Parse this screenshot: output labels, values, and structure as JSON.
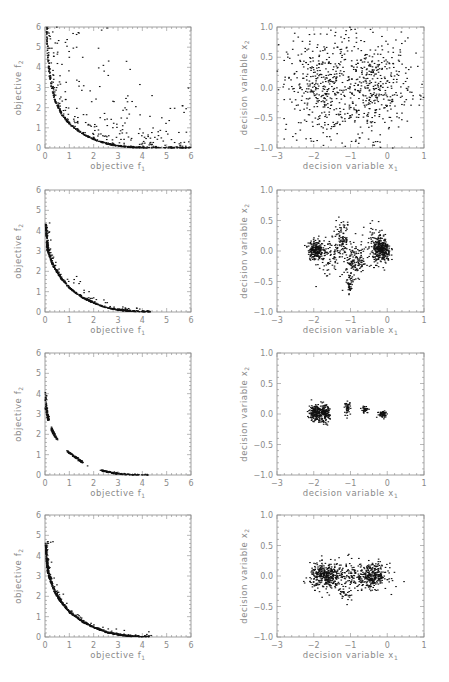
{
  "figure": {
    "rows": 4,
    "columns": 2,
    "axis_color": "#8a8a8a",
    "point_color": "#111111"
  },
  "labels": {
    "objective_x": "objective f",
    "objective_x_sub": "1",
    "objective_y": "objective f",
    "objective_y_sub": "2",
    "decision_x": "decision variable x",
    "decision_x_sub": "1",
    "decision_y": "decision variable x",
    "decision_y_sub": "2"
  },
  "chart_data": [
    {
      "panel": "row1-left",
      "type": "scatter",
      "xlabel": "objective f1",
      "ylabel": "objective f2",
      "xlim": [
        0,
        6
      ],
      "ylim": [
        0,
        6
      ],
      "xticks": [
        "0",
        "1",
        "2",
        "3",
        "4",
        "5",
        "6"
      ],
      "yticks": [
        "0",
        "1",
        "2",
        "3",
        "4",
        "5",
        "6"
      ],
      "description": "Dense front along convex curve plus widely scattered dominated points",
      "front": [
        [
          0.05,
          6.0
        ],
        [
          0.1,
          4.5
        ],
        [
          0.2,
          3.3
        ],
        [
          0.4,
          2.3
        ],
        [
          0.7,
          1.6
        ],
        [
          1.0,
          1.15
        ],
        [
          1.5,
          0.7
        ],
        [
          2.0,
          0.4
        ],
        [
          2.5,
          0.2
        ],
        [
          3.0,
          0.08
        ],
        [
          3.5,
          0.02
        ],
        [
          4.0,
          0.0
        ],
        [
          5.0,
          0.0
        ],
        [
          6.0,
          0.0
        ]
      ],
      "scatter_spread": 2.2,
      "n_front": 420,
      "n_scatter": 260,
      "outliers": [
        [
          1.3,
          5.0
        ],
        [
          2.2,
          4.95
        ],
        [
          3.35,
          4.3
        ],
        [
          3.5,
          3.9
        ],
        [
          2.6,
          3.6
        ],
        [
          3.9,
          3.15
        ],
        [
          2.4,
          4.1
        ],
        [
          4.4,
          2.6
        ],
        [
          5.65,
          2.1
        ],
        [
          5.8,
          1.95
        ],
        [
          4.8,
          1.5
        ],
        [
          3.35,
          1.9
        ],
        [
          2.55,
          5.95
        ],
        [
          1.4,
          5.7
        ],
        [
          1.0,
          4.5
        ],
        [
          1.55,
          4.5
        ]
      ]
    },
    {
      "panel": "row1-right",
      "type": "scatter",
      "xlabel": "decision variable x1",
      "ylabel": "decision variable x2",
      "xlim": [
        -3,
        1
      ],
      "ylim": [
        -1,
        1
      ],
      "xticks": [
        "-3",
        "-2",
        "-1",
        "0",
        "1"
      ],
      "yticks": [
        "-1.0",
        "-0.5",
        "0.0",
        "0.5",
        "1.0"
      ],
      "description": "Points spread across domain with two loose concentrations near (-1.8,0) and (-0.3,0)",
      "clusters": [
        {
          "cx": -1.8,
          "cy": 0.0,
          "sx": 0.45,
          "sy": 0.4,
          "n": 330
        },
        {
          "cx": -0.35,
          "cy": 0.0,
          "sx": 0.45,
          "sy": 0.4,
          "n": 300
        },
        {
          "cx": -1.0,
          "cy": 0.0,
          "sx": 1.1,
          "sy": 0.6,
          "n": 260
        }
      ]
    },
    {
      "panel": "row2-left",
      "type": "scatter",
      "xlabel": "objective f1",
      "ylabel": "objective f2",
      "xlim": [
        0,
        6
      ],
      "ylim": [
        0,
        6
      ],
      "xticks": [
        "0",
        "1",
        "2",
        "3",
        "4",
        "5",
        "6"
      ],
      "yticks": [
        "0",
        "1",
        "2",
        "3",
        "4",
        "5",
        "6"
      ],
      "description": "Tight front from (0,4.3) to (4.3,0) with few nearby points",
      "front": [
        [
          0.02,
          4.3
        ],
        [
          0.05,
          3.5
        ],
        [
          0.1,
          3.0
        ],
        [
          0.3,
          2.3
        ],
        [
          0.6,
          1.7
        ],
        [
          1.0,
          1.15
        ],
        [
          1.5,
          0.7
        ],
        [
          2.0,
          0.42
        ],
        [
          2.5,
          0.2
        ],
        [
          3.0,
          0.08
        ],
        [
          3.5,
          0.02
        ],
        [
          4.3,
          0.0
        ]
      ],
      "scatter_spread": 0.25,
      "n_front": 520,
      "n_scatter": 90,
      "outliers": [
        [
          1.2,
          1.6
        ],
        [
          1.3,
          1.75
        ],
        [
          1.4,
          1.4
        ],
        [
          1.45,
          1.5
        ],
        [
          0.3,
          2.8
        ],
        [
          0.35,
          2.7
        ],
        [
          1.8,
          0.7
        ],
        [
          2.0,
          0.7
        ],
        [
          3.2,
          0.25
        ],
        [
          3.3,
          0.2
        ]
      ]
    },
    {
      "panel": "row2-right",
      "type": "scatter",
      "xlabel": "decision variable x1",
      "ylabel": "decision variable x2",
      "xlim": [
        -3,
        1
      ],
      "ylim": [
        -1,
        1
      ],
      "xticks": [
        "-3",
        "-2",
        "-1",
        "0",
        "1"
      ],
      "yticks": [
        "-1.0",
        "-0.5",
        "0.0",
        "0.5",
        "1.0"
      ],
      "description": "Dense clusters near (-1.95,0.02) and (-0.15,0); scattered bridge points and a tail near (-1,-0.55)",
      "clusters": [
        {
          "cx": -1.95,
          "cy": 0.02,
          "sx": 0.1,
          "sy": 0.08,
          "n": 230
        },
        {
          "cx": -0.15,
          "cy": 0.0,
          "sx": 0.12,
          "sy": 0.1,
          "n": 300
        },
        {
          "cx": -1.25,
          "cy": 0.2,
          "sx": 0.13,
          "sy": 0.14,
          "n": 110
        },
        {
          "cx": -0.85,
          "cy": -0.18,
          "sx": 0.18,
          "sy": 0.12,
          "n": 140
        },
        {
          "cx": -1.02,
          "cy": -0.55,
          "sx": 0.04,
          "sy": 0.09,
          "n": 45
        },
        {
          "cx": -1.6,
          "cy": -0.1,
          "sx": 0.15,
          "sy": 0.18,
          "n": 70
        },
        {
          "cx": -0.3,
          "cy": 0.15,
          "sx": 0.15,
          "sy": 0.15,
          "n": 70
        }
      ]
    },
    {
      "panel": "row3-left",
      "type": "scatter",
      "xlabel": "objective f1",
      "ylabel": "objective f2",
      "xlim": [
        0,
        6
      ],
      "ylim": [
        0,
        6
      ],
      "xticks": [
        "0",
        "1",
        "2",
        "3",
        "4",
        "5",
        "6"
      ],
      "yticks": [
        "0",
        "1",
        "2",
        "3",
        "4",
        "5",
        "6"
      ],
      "description": "Disconnected front segments",
      "segments": [
        {
          "points": [
            [
              0.02,
              4.1
            ],
            [
              0.05,
              3.3
            ],
            [
              0.1,
              2.95
            ],
            [
              0.15,
              2.7
            ]
          ],
          "n": 90
        },
        {
          "points": [
            [
              0.25,
              2.35
            ],
            [
              0.35,
              2.05
            ],
            [
              0.5,
              1.75
            ]
          ],
          "n": 60
        },
        {
          "points": [
            [
              0.9,
              1.2
            ],
            [
              1.1,
              1.0
            ],
            [
              1.4,
              0.75
            ],
            [
              1.55,
              0.62
            ]
          ],
          "n": 90
        },
        {
          "points": [
            [
              2.3,
              0.22
            ],
            [
              2.7,
              0.13
            ],
            [
              3.0,
              0.07
            ],
            [
              3.5,
              0.02
            ],
            [
              4.0,
              0.0
            ],
            [
              4.35,
              0.0
            ]
          ],
          "n": 160
        }
      ],
      "outliers": [
        [
          1.75,
          0.45
        ]
      ]
    },
    {
      "panel": "row3-right",
      "type": "scatter",
      "xlabel": "decision variable x1",
      "ylabel": "decision variable x2",
      "xlim": [
        -3,
        1
      ],
      "ylim": [
        -1,
        1
      ],
      "xticks": [
        "-3",
        "-2",
        "-1",
        "0",
        "1"
      ],
      "yticks": [
        "-1.0",
        "-0.5",
        "0.0",
        "0.5",
        "1.0"
      ],
      "description": "Separate tight clusters along x2≈0",
      "clusters": [
        {
          "cx": -1.95,
          "cy": 0.02,
          "sx": 0.09,
          "sy": 0.07,
          "n": 200
        },
        {
          "cx": -1.7,
          "cy": 0.0,
          "sx": 0.07,
          "sy": 0.07,
          "n": 140
        },
        {
          "cx": -1.08,
          "cy": 0.1,
          "sx": 0.04,
          "sy": 0.05,
          "n": 45
        },
        {
          "cx": -0.6,
          "cy": 0.07,
          "sx": 0.05,
          "sy": 0.03,
          "n": 35
        },
        {
          "cx": -0.12,
          "cy": 0.0,
          "sx": 0.07,
          "sy": 0.03,
          "n": 60
        }
      ]
    },
    {
      "panel": "row4-left",
      "type": "scatter",
      "xlabel": "objective f1",
      "ylabel": "objective f2",
      "xlim": [
        0,
        6
      ],
      "ylim": [
        0,
        6
      ],
      "xticks": [
        "0",
        "1",
        "2",
        "3",
        "4",
        "5",
        "6"
      ],
      "yticks": [
        "0",
        "1",
        "2",
        "3",
        "4",
        "5",
        "6"
      ],
      "description": "Dense continuous front from (0,4.6) to (4.3,0) with slight spread",
      "front": [
        [
          0.02,
          4.6
        ],
        [
          0.05,
          3.8
        ],
        [
          0.1,
          3.2
        ],
        [
          0.3,
          2.4
        ],
        [
          0.6,
          1.75
        ],
        [
          1.0,
          1.2
        ],
        [
          1.5,
          0.75
        ],
        [
          2.0,
          0.45
        ],
        [
          2.5,
          0.22
        ],
        [
          3.0,
          0.09
        ],
        [
          3.5,
          0.02
        ],
        [
          4.3,
          0.0
        ]
      ],
      "scatter_spread": 0.22,
      "n_front": 650,
      "n_scatter": 120,
      "outliers": [
        [
          1.0,
          1.2
        ],
        [
          1.4,
          1.05
        ],
        [
          1.35,
          1.1
        ],
        [
          2.6,
          0.4
        ],
        [
          3.1,
          0.12
        ]
      ]
    },
    {
      "panel": "row4-right",
      "type": "scatter",
      "xlabel": "decision variable x1",
      "ylabel": "decision variable x2",
      "xlim": [
        -3,
        1
      ],
      "ylim": [
        -1,
        1
      ],
      "xticks": [
        "-3",
        "-2",
        "-1",
        "0",
        "1"
      ],
      "yticks": [
        "-1.0",
        "-0.5",
        "0.0",
        "0.5",
        "1.0"
      ],
      "description": "Two broad clusters around (-1.7,0) and (-0.35,0) connected by sparse band",
      "clusters": [
        {
          "cx": -1.7,
          "cy": 0.0,
          "sx": 0.2,
          "sy": 0.1,
          "n": 320
        },
        {
          "cx": -0.4,
          "cy": 0.0,
          "sx": 0.2,
          "sy": 0.1,
          "n": 300
        },
        {
          "cx": -1.1,
          "cy": 0.0,
          "sx": 0.3,
          "sy": 0.13,
          "n": 160
        },
        {
          "cx": -1.2,
          "cy": -0.3,
          "sx": 0.1,
          "sy": 0.08,
          "n": 30
        }
      ]
    }
  ]
}
